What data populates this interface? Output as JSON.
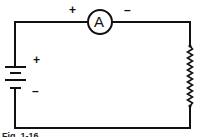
{
  "figure": {
    "type": "circuit-schematic",
    "caption": "Fig. 1-16",
    "components": [
      {
        "id": "ammeter",
        "symbol_letter": "A",
        "plus_label": "+",
        "minus_label": "–"
      },
      {
        "id": "battery",
        "plus_label": "+",
        "minus_label": "–"
      },
      {
        "id": "resistor"
      }
    ],
    "colors": {
      "line": "#111111",
      "background": "#ffffff"
    }
  }
}
